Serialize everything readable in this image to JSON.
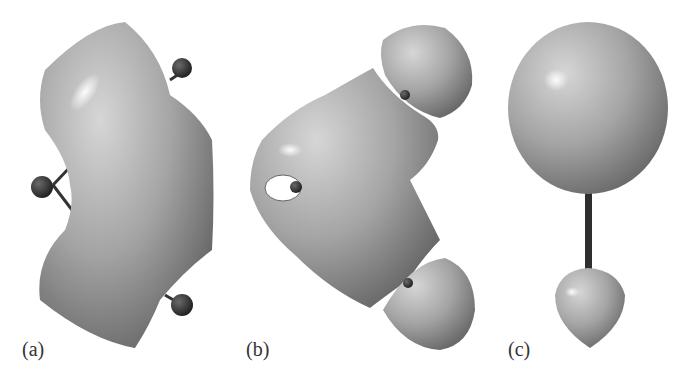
{
  "figure": {
    "panels": [
      {
        "id": "a",
        "label": "(a)",
        "description": "Bent banana-shaped isosurface with three atoms (one left, two right)"
      },
      {
        "id": "b",
        "label": "(b)",
        "description": "Central lobe with small hole plus two separate hemispherical lobes at right"
      },
      {
        "id": "c",
        "label": "(c)",
        "description": "Large sphere above small teardrop lobe joined by a bond rod"
      }
    ],
    "colors": {
      "surface": "#a8a8a8",
      "surface_dark": "#6e6e6e",
      "highlight": "#f2f2f2",
      "atom": "#2e2e2e",
      "background": "#ffffff"
    }
  }
}
